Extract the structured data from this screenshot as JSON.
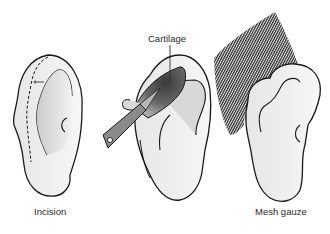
{
  "figure": {
    "panels": [
      {
        "id": "incision",
        "label": "Incision"
      },
      {
        "id": "cartilage",
        "label": "Cartilage"
      },
      {
        "id": "mesh",
        "label": "Mesh gauze"
      }
    ]
  },
  "colors": {
    "ear_fill": "#efefef",
    "ear_stroke": "#1a1a1a",
    "concha_shade": "#cfcfcf",
    "cartilage_dark": "#4a4a4a",
    "instrument": "#8a8a8a",
    "mesh_line": "#2b2b2b"
  }
}
